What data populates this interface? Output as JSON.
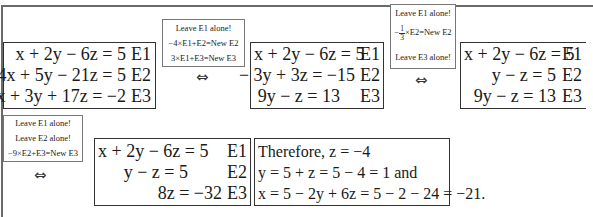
{
  "systems": [
    {
      "rows": [
        {
          "lhs": "x + 2y − 6z = 5",
          "label": "E1"
        },
        {
          "lhs": "4x + 5y − 21z = 5",
          "label": "E2"
        },
        {
          "lhs": "−3x + 3y + 17z = −2",
          "label": "E3"
        }
      ]
    },
    {
      "rows": [
        {
          "lhs": "x + 2y − 6z = 5",
          "label": "E1"
        },
        {
          "lhs": "− 3y + 3z = −15",
          "label": "E2"
        },
        {
          "lhs": "9y − z = 13",
          "label": "E3"
        }
      ]
    },
    {
      "rows": [
        {
          "lhs": "x + 2y − 6z = 5",
          "label": "E1"
        },
        {
          "lhs": "y − z = 5",
          "label": "E2"
        },
        {
          "lhs": "9y − z = 13",
          "label": "E3"
        }
      ]
    },
    {
      "rows": [
        {
          "lhs": "x + 2y − 6z = 5",
          "label": "E1"
        },
        {
          "lhs": "y − z = 5",
          "label": "E2"
        },
        {
          "lhs": "8z = −32",
          "label": "E3"
        }
      ]
    }
  ],
  "operations": [
    {
      "lines": [
        "Leave E1 alone!",
        "−4×E1+E2=New E2",
        "3×E1+E3=New E3"
      ]
    },
    {
      "lines": [
        "Leave E1 alone!",
        "×E2=New E2",
        "Leave E3 alone!"
      ],
      "fraction": {
        "sign": "−",
        "num": "1",
        "den": "3"
      }
    },
    {
      "lines": [
        "Leave E1 alone!",
        "Leave E2 alone!",
        "−9×E2+E3=New E3"
      ]
    }
  ],
  "equivalence_symbol": "⇔",
  "solution": {
    "lines": [
      "Therefore,  z = −4",
      "y = 5 + z = 5 − 4 = 1  and",
      "x = 5 − 2y + 6z = 5 − 2 − 24 = −21."
    ]
  }
}
